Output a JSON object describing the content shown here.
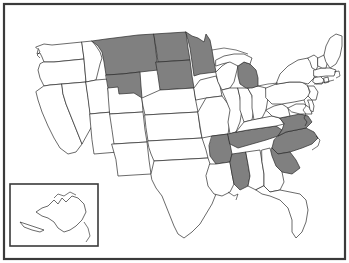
{
  "map": {
    "title": "United States choropleth map",
    "description": "Outline map of the contiguous United States with an Alaska inset; a subset of states is filled solid gray while all others are white.",
    "projection_note": "contiguous US with Alaska inset at lower left",
    "frame": {
      "present": true,
      "color": "#3a3a3a",
      "label": "map-border"
    },
    "colors": {
      "background": "#ffffff",
      "highlight_fill": "#808080",
      "default_fill": "#ffffff",
      "state_outline": "#2b2b2b",
      "frame_stroke": "#3a3a3a"
    },
    "legend": {
      "visible": false,
      "highlight_meaning": "selected states",
      "default_meaning": "unselected states"
    },
    "inset": {
      "name": "Alaska",
      "abbr": "AK",
      "highlighted": false,
      "has_border": true
    },
    "counts": {
      "highlighted": 12,
      "total_shown": 49
    },
    "highlighted_states": [
      {
        "abbr": "MT",
        "name": "Montana",
        "fill": "full"
      },
      {
        "abbr": "ND",
        "name": "North Dakota",
        "fill": "full"
      },
      {
        "abbr": "SD",
        "name": "South Dakota",
        "fill": "full"
      },
      {
        "abbr": "WY",
        "name": "Wyoming",
        "fill": "partial-north"
      },
      {
        "abbr": "MN",
        "name": "Minnesota",
        "fill": "full"
      },
      {
        "abbr": "MI",
        "name": "Michigan",
        "fill": "lower-peninsula"
      },
      {
        "abbr": "AR",
        "name": "Arkansas",
        "fill": "full"
      },
      {
        "abbr": "MS",
        "name": "Mississippi",
        "fill": "full"
      },
      {
        "abbr": "TN",
        "name": "Tennessee",
        "fill": "full"
      },
      {
        "abbr": "NC",
        "name": "North Carolina",
        "fill": "full"
      },
      {
        "abbr": "SC",
        "name": "South Carolina",
        "fill": "full"
      },
      {
        "abbr": "VA",
        "name": "Virginia",
        "fill": "full"
      }
    ],
    "plain_states": [
      {
        "abbr": "WA",
        "name": "Washington"
      },
      {
        "abbr": "OR",
        "name": "Oregon"
      },
      {
        "abbr": "CA",
        "name": "California"
      },
      {
        "abbr": "NV",
        "name": "Nevada"
      },
      {
        "abbr": "ID",
        "name": "Idaho"
      },
      {
        "abbr": "UT",
        "name": "Utah"
      },
      {
        "abbr": "AZ",
        "name": "Arizona"
      },
      {
        "abbr": "CO",
        "name": "Colorado"
      },
      {
        "abbr": "NM",
        "name": "New Mexico"
      },
      {
        "abbr": "NE",
        "name": "Nebraska"
      },
      {
        "abbr": "KS",
        "name": "Kansas"
      },
      {
        "abbr": "OK",
        "name": "Oklahoma"
      },
      {
        "abbr": "TX",
        "name": "Texas"
      },
      {
        "abbr": "IA",
        "name": "Iowa"
      },
      {
        "abbr": "MO",
        "name": "Missouri"
      },
      {
        "abbr": "LA",
        "name": "Louisiana"
      },
      {
        "abbr": "WI",
        "name": "Wisconsin"
      },
      {
        "abbr": "IL",
        "name": "Illinois"
      },
      {
        "abbr": "IN",
        "name": "Indiana"
      },
      {
        "abbr": "OH",
        "name": "Ohio"
      },
      {
        "abbr": "KY",
        "name": "Kentucky"
      },
      {
        "abbr": "AL",
        "name": "Alabama"
      },
      {
        "abbr": "GA",
        "name": "Georgia"
      },
      {
        "abbr": "FL",
        "name": "Florida"
      },
      {
        "abbr": "WV",
        "name": "West Virginia"
      },
      {
        "abbr": "PA",
        "name": "Pennsylvania"
      },
      {
        "abbr": "NY",
        "name": "New York"
      },
      {
        "abbr": "VT",
        "name": "Vermont"
      },
      {
        "abbr": "NH",
        "name": "New Hampshire"
      },
      {
        "abbr": "ME",
        "name": "Maine"
      },
      {
        "abbr": "MA",
        "name": "Massachusetts"
      },
      {
        "abbr": "RI",
        "name": "Rhode Island"
      },
      {
        "abbr": "CT",
        "name": "Connecticut"
      },
      {
        "abbr": "NJ",
        "name": "New Jersey"
      },
      {
        "abbr": "DE",
        "name": "Delaware"
      },
      {
        "abbr": "MD",
        "name": "Maryland"
      },
      {
        "abbr": "AK",
        "name": "Alaska"
      }
    ]
  }
}
